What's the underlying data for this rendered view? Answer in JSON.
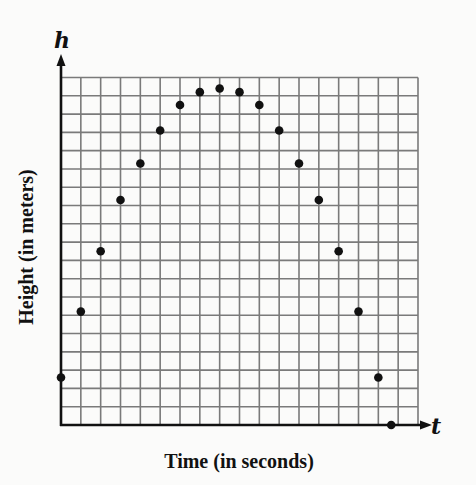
{
  "chart_data": {
    "type": "scatter",
    "title": "",
    "xlabel": "Time (in seconds)",
    "ylabel": "Height (in meters)",
    "x_axis_variable": "t",
    "y_axis_variable": "h",
    "xlim": [
      0,
      18
    ],
    "ylim": [
      0,
      19
    ],
    "grid": true,
    "grid_columns": 18,
    "grid_rows": 19,
    "tick_labels": "none",
    "legend": "none",
    "series": [
      {
        "name": "height",
        "x": [
          0,
          1,
          2,
          3,
          4,
          5,
          6,
          7,
          8,
          9,
          10,
          11,
          12,
          13,
          14,
          15,
          16,
          16.65
        ],
        "values": [
          2.6,
          6.2,
          9.5,
          12.3,
          14.3,
          16.1,
          17.5,
          18.2,
          18.4,
          18.2,
          17.5,
          16.1,
          14.3,
          12.3,
          9.5,
          6.2,
          2.6,
          0
        ]
      }
    ]
  },
  "colors": {
    "background": "#fbfbfa",
    "grid": "#7a7a7a",
    "axis": "#111111",
    "point": "#111111"
  }
}
